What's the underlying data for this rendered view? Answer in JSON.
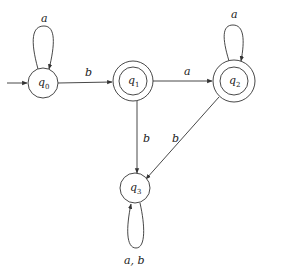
{
  "diagram": {
    "type": "DFA state diagram",
    "states": [
      {
        "id": "q0",
        "name": "q",
        "sub": "0",
        "cx": 43,
        "cy": 83,
        "r": 15,
        "accepting": false,
        "initial": true
      },
      {
        "id": "q1",
        "name": "q",
        "sub": "1",
        "cx": 133,
        "cy": 81,
        "r": 20,
        "accepting": true,
        "initial": false
      },
      {
        "id": "q2",
        "name": "q",
        "sub": "2",
        "cx": 234,
        "cy": 81,
        "r": 21,
        "accepting": true,
        "initial": false
      },
      {
        "id": "q3",
        "name": "q",
        "sub": "3",
        "cx": 133,
        "cy": 188,
        "r": 15,
        "accepting": false,
        "initial": false
      }
    ],
    "transitions": [
      {
        "from": "q0",
        "to": "q0",
        "label": "a"
      },
      {
        "from": "q0",
        "to": "q1",
        "label": "b"
      },
      {
        "from": "q1",
        "to": "q2",
        "label": "a"
      },
      {
        "from": "q1",
        "to": "q3",
        "label": "b"
      },
      {
        "from": "q2",
        "to": "q2",
        "label": "a"
      },
      {
        "from": "q2",
        "to": "q3",
        "label": "b"
      },
      {
        "from": "q3",
        "to": "q3",
        "label": "a, b"
      }
    ],
    "colors": {
      "stroke": "#333333",
      "text": "#222222",
      "background": "#ffffff"
    }
  }
}
